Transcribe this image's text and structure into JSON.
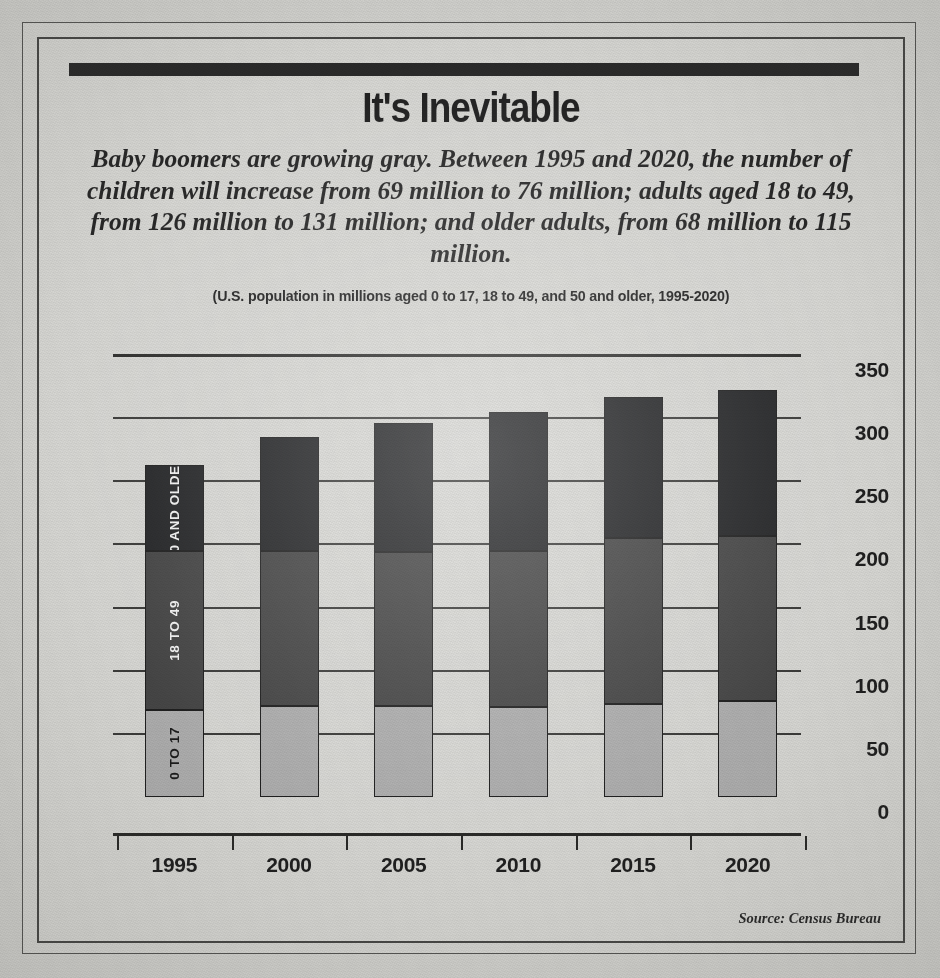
{
  "header": {
    "title": "It's Inevitable",
    "subtitle": "Baby boomers are growing gray. Between 1995 and 2020, the number of children will increase from 69 million to 76 million; adults aged 18 to 49, from 126 million to 131 million; and older adults, from 68 million to 115 million.",
    "caption": "(U.S. population in millions aged 0 to 17, 18 to 49, and 50 and older, 1995-2020)"
  },
  "footer": {
    "source": "Source: Census Bureau"
  },
  "colors": {
    "series_young": "#a8a8a8",
    "series_mid": "#3a3a3a",
    "series_old": "#17181a",
    "paper": "#d4d4d0",
    "ink": "#111111"
  },
  "chart_data": {
    "type": "bar",
    "stacked": true,
    "title": "It's Inevitable",
    "subtitle": "(U.S. population in millions aged 0 to 17, 18 to 49, and 50 and older, 1995-2020)",
    "xlabel": "",
    "ylabel": "",
    "ylim": [
      0,
      350
    ],
    "yticks": [
      0,
      50,
      100,
      150,
      200,
      250,
      300,
      350
    ],
    "ytick_labels": [
      "0",
      "50",
      "100",
      "150",
      "200",
      "250",
      "300",
      "350"
    ],
    "y_axis_position": "right",
    "grid": true,
    "legend": "in-bar-rotated-labels",
    "categories": [
      "1995",
      "2000",
      "2005",
      "2010",
      "2015",
      "2020"
    ],
    "series": [
      {
        "name": "0 TO 17",
        "values": [
          69,
          72,
          72,
          71,
          74,
          76
        ]
      },
      {
        "name": "18 TO 49",
        "values": [
          126,
          123,
          122,
          124,
          131,
          131
        ]
      },
      {
        "name": "50 AND OLDER",
        "values": [
          68,
          90,
          102,
          110,
          112,
          115
        ]
      }
    ],
    "totals": [
      263,
      285,
      296,
      305,
      317,
      322
    ],
    "units": "millions of people"
  }
}
